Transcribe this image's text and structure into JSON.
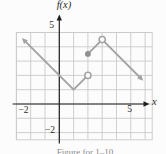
{
  "figure": {
    "labels": {
      "function_axis": "f(x)",
      "x_axis": "x",
      "y_tick_top": "5",
      "y_tick_bottom": "−2",
      "x_tick_left": "−2",
      "x_tick_right": "5"
    },
    "caption": "Figure for 1–10"
  },
  "chart_data": {
    "type": "line",
    "title": "",
    "xlabel": "x",
    "ylabel": "f(x)",
    "xlim": [
      -3,
      6.5
    ],
    "ylim": [
      -2.5,
      5
    ],
    "grid": true,
    "x_ticks_labeled": [
      -2,
      5
    ],
    "y_ticks_labeled": [
      -2,
      5
    ],
    "series": [
      {
        "name": "left-piece",
        "points": [
          [
            -2.5,
            4.5
          ],
          [
            1,
            1
          ],
          [
            2,
            2
          ]
        ],
        "start_cap": "arrow",
        "end_cap": "none"
      },
      {
        "name": "right-piece",
        "points": [
          [
            2,
            3.5
          ],
          [
            3,
            4.5
          ],
          [
            5.75,
            1.75
          ]
        ],
        "start_cap": "none",
        "end_cap": "arrow"
      }
    ],
    "point_markers": [
      {
        "kind": "open-circle",
        "x": 2,
        "y": 2
      },
      {
        "kind": "filled-dot",
        "x": 2,
        "y": 3.5
      },
      {
        "kind": "open-circle",
        "x": 3,
        "y": 4.5
      }
    ],
    "colors": {
      "curve": "#a3a3a3",
      "dot": "#8f8f8f",
      "grid": "#cbcbcb",
      "axis": "#1f1f1f",
      "background": "#fcfcfc"
    }
  }
}
